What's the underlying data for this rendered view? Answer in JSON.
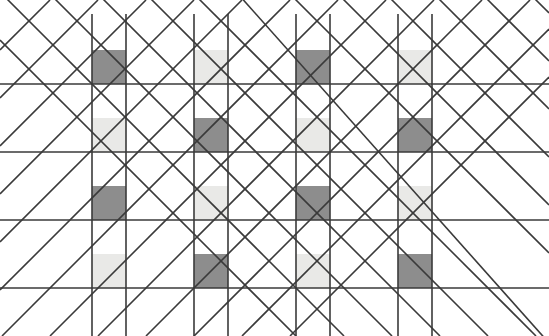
{
  "figure": {
    "type": "line-lattice-with-filled-squares",
    "width": 549,
    "height": 336,
    "background_color": "#ffffff"
  },
  "colors": {
    "line": "#3a3a3a",
    "dark_square": "#8d8d8d",
    "light_square": "#e9e9e7",
    "background": "#ffffff"
  },
  "geometry": {
    "cell_size": 34,
    "square_size": 34,
    "column_period": 102,
    "row_period": 68,
    "line_width": 1.6,
    "diagonal_spacing": 48,
    "horizontal_line_y": [
      84,
      152,
      220,
      288
    ],
    "vertical_line_x": [
      92,
      126,
      194,
      228,
      296,
      330,
      398,
      432
    ],
    "square_columns_x": [
      92,
      194,
      296,
      398
    ],
    "square_rows_y": [
      50,
      118,
      186,
      254
    ]
  },
  "squares": [
    {
      "row": 0,
      "col": 0,
      "x": 92,
      "y": 50,
      "shade": "dark"
    },
    {
      "row": 0,
      "col": 1,
      "x": 194,
      "y": 50,
      "shade": "light"
    },
    {
      "row": 0,
      "col": 2,
      "x": 296,
      "y": 50,
      "shade": "dark"
    },
    {
      "row": 0,
      "col": 3,
      "x": 398,
      "y": 50,
      "shade": "light"
    },
    {
      "row": 1,
      "col": 0,
      "x": 92,
      "y": 118,
      "shade": "light"
    },
    {
      "row": 1,
      "col": 1,
      "x": 194,
      "y": 118,
      "shade": "dark"
    },
    {
      "row": 1,
      "col": 2,
      "x": 296,
      "y": 118,
      "shade": "light"
    },
    {
      "row": 1,
      "col": 3,
      "x": 398,
      "y": 118,
      "shade": "dark"
    },
    {
      "row": 2,
      "col": 0,
      "x": 92,
      "y": 186,
      "shade": "dark"
    },
    {
      "row": 2,
      "col": 1,
      "x": 194,
      "y": 186,
      "shade": "light"
    },
    {
      "row": 2,
      "col": 2,
      "x": 296,
      "y": 186,
      "shade": "dark"
    },
    {
      "row": 2,
      "col": 3,
      "x": 398,
      "y": 186,
      "shade": "light"
    },
    {
      "row": 3,
      "col": 0,
      "x": 92,
      "y": 254,
      "shade": "light"
    },
    {
      "row": 3,
      "col": 1,
      "x": 194,
      "y": 254,
      "shade": "dark"
    },
    {
      "row": 3,
      "col": 2,
      "x": 296,
      "y": 254,
      "shade": "light"
    },
    {
      "row": 3,
      "col": 3,
      "x": 398,
      "y": 254,
      "shade": "dark"
    }
  ],
  "horizontal_lines": [
    {
      "y": 84,
      "x1": 0,
      "x2": 549
    },
    {
      "y": 152,
      "x1": 0,
      "x2": 549
    },
    {
      "y": 220,
      "x1": 0,
      "x2": 549
    },
    {
      "y": 288,
      "x1": 0,
      "x2": 549
    }
  ],
  "vertical_lines": [
    {
      "x": 92,
      "y1": 14,
      "y2": 336
    },
    {
      "x": 126,
      "y1": 14,
      "y2": 336
    },
    {
      "x": 194,
      "y1": 14,
      "y2": 336
    },
    {
      "x": 228,
      "y1": 14,
      "y2": 336
    },
    {
      "x": 296,
      "y1": 14,
      "y2": 336
    },
    {
      "x": 330,
      "y1": 14,
      "y2": 336
    },
    {
      "x": 398,
      "y1": 14,
      "y2": 336
    },
    {
      "x": 432,
      "y1": 14,
      "y2": 336
    }
  ],
  "diagonals_down": [
    {
      "c": -40,
      "x1": 0,
      "y1": 40,
      "x2": 296,
      "y2": 336
    },
    {
      "c": 8,
      "x1": 0,
      "y1": -8,
      "x2": 344,
      "y2": 336
    },
    {
      "c": 56,
      "x1": 14,
      "y1": -42,
      "x2": 392,
      "y2": 336
    },
    {
      "c": 104,
      "x1": 62,
      "y1": -42,
      "x2": 440,
      "y2": 336
    },
    {
      "c": 152,
      "x1": 110,
      "y1": -42,
      "x2": 488,
      "y2": 336
    },
    {
      "c": 200,
      "x1": 158,
      "y1": -42,
      "x2": 536,
      "y2": 336
    },
    {
      "c": 248,
      "x1": 206,
      "y1": -42,
      "x2": 549,
      "y2": 343
    },
    {
      "c": 296,
      "x1": 254,
      "y1": -42,
      "x2": 549,
      "y2": 253
    },
    {
      "c": 344,
      "x1": 302,
      "y1": -42,
      "x2": 549,
      "y2": 205
    },
    {
      "c": 392,
      "x1": 350,
      "y1": -42,
      "x2": 549,
      "y2": 157
    },
    {
      "c": 440,
      "x1": 398,
      "y1": -42,
      "x2": 549,
      "y2": 109
    },
    {
      "c": 488,
      "x1": 446,
      "y1": -42,
      "x2": 549,
      "y2": 61
    },
    {
      "c": 536,
      "x1": 494,
      "y1": -42,
      "x2": 549,
      "y2": 13
    }
  ],
  "diagonals_up": [
    {
      "c": 50,
      "x1": 0,
      "y1": 50,
      "x2": 50,
      "y2": 0
    },
    {
      "c": 98,
      "x1": 0,
      "y1": 98,
      "x2": 98,
      "y2": 0
    },
    {
      "c": 146,
      "x1": 0,
      "y1": 146,
      "x2": 146,
      "y2": 0
    },
    {
      "c": 194,
      "x1": 0,
      "y1": 194,
      "x2": 194,
      "y2": 0
    },
    {
      "c": 242,
      "x1": 0,
      "y1": 242,
      "x2": 242,
      "y2": 0
    },
    {
      "c": 290,
      "x1": 0,
      "y1": 290,
      "x2": 290,
      "y2": 0
    },
    {
      "c": 338,
      "x1": 2,
      "y1": 336,
      "x2": 338,
      "y2": 0
    },
    {
      "c": 386,
      "x1": 50,
      "y1": 336,
      "x2": 386,
      "y2": 0
    },
    {
      "c": 434,
      "x1": 98,
      "y1": 336,
      "x2": 434,
      "y2": 0
    },
    {
      "c": 482,
      "x1": 146,
      "y1": 336,
      "x2": 482,
      "y2": 0
    },
    {
      "c": 530,
      "x1": 194,
      "y1": 336,
      "x2": 530,
      "y2": 0
    },
    {
      "c": 578,
      "x1": 242,
      "y1": 336,
      "x2": 549,
      "y2": 29
    },
    {
      "c": 626,
      "x1": 290,
      "y1": 336,
      "x2": 549,
      "y2": 77
    }
  ]
}
